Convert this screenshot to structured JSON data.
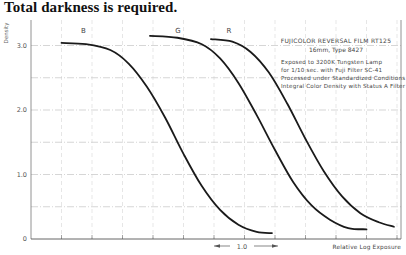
{
  "caption": "Total darkness is required.",
  "chart_data": {
    "type": "line",
    "title": "FUJICOLOR REVERSAL FILM RT125",
    "subtitle": "16mm, Type 8427",
    "annotations": [
      "Exposed to 3200K Tungsten Lamp",
      "for 1/10 sec. with Fuji Filter SC-41",
      "Processed under Standardized Conditions",
      "Integral Color Density with Status A Filter"
    ],
    "xlabel": "Relative Log Exposure",
    "ylabel": "Density",
    "yticks": [
      "0",
      "1.0",
      "2.0",
      "3.0"
    ],
    "ylim": [
      0,
      3.4
    ],
    "xlim": [
      0,
      6.0
    ],
    "x_scale_marker": "1.0",
    "grid": true,
    "legend_position": "inline labels above curves",
    "series": [
      {
        "name": "B",
        "x": [
          0.5,
          0.9,
          1.3,
          1.6,
          1.9,
          2.2,
          2.5,
          2.8,
          3.1,
          3.4,
          3.7,
          3.95
        ],
        "values": [
          3.04,
          3.02,
          2.93,
          2.72,
          2.36,
          1.88,
          1.32,
          0.82,
          0.45,
          0.22,
          0.11,
          0.09
        ]
      },
      {
        "name": "G",
        "x": [
          1.95,
          2.4,
          2.8,
          3.1,
          3.4,
          3.7,
          4.0,
          4.3,
          4.6,
          4.9,
          5.2,
          5.5
        ],
        "values": [
          3.15,
          3.12,
          3.02,
          2.8,
          2.42,
          1.92,
          1.38,
          0.88,
          0.52,
          0.3,
          0.17,
          0.15
        ]
      },
      {
        "name": "R",
        "x": [
          2.95,
          3.3,
          3.6,
          3.9,
          4.2,
          4.5,
          4.8,
          5.1,
          5.4,
          5.7,
          5.95
        ],
        "values": [
          3.1,
          3.06,
          2.9,
          2.58,
          2.1,
          1.55,
          1.05,
          0.66,
          0.4,
          0.26,
          0.19
        ]
      }
    ]
  }
}
